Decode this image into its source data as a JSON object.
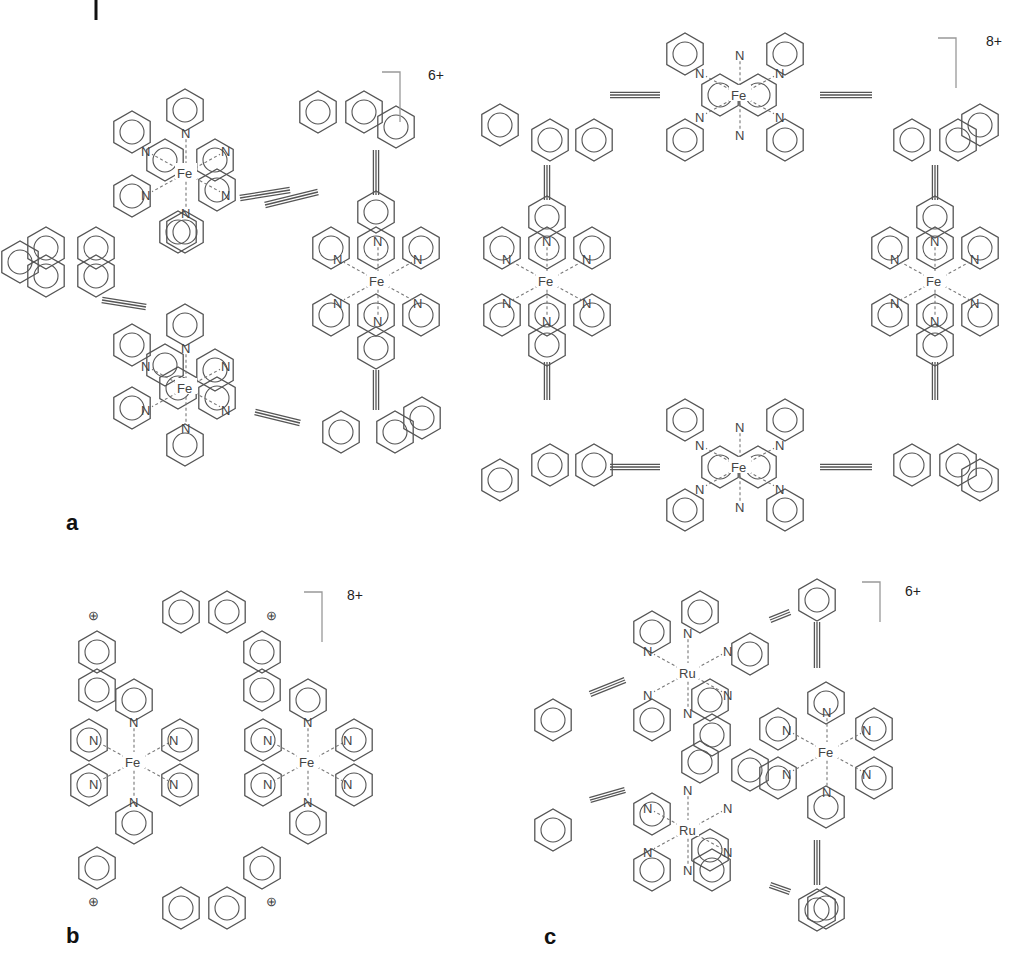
{
  "figure": {
    "top_fragment": {
      "text": "(   )                                              (   )",
      "x": 140,
      "y": 4
    },
    "panels": [
      {
        "id": "a",
        "label": "a",
        "x": 66,
        "y": 530
      },
      {
        "id": "b",
        "label": "b",
        "x": 66,
        "y": 943
      },
      {
        "id": "c",
        "label": "c",
        "x": 544,
        "y": 944
      }
    ],
    "charges": [
      {
        "panel": "a-left",
        "text": "6+",
        "x": 428,
        "y": 80,
        "bx": 400,
        "by": 72,
        "bh": 50
      },
      {
        "panel": "a-right",
        "text": "8+",
        "x": 986,
        "y": 46,
        "bx": 956,
        "by": 38,
        "bh": 50
      },
      {
        "panel": "b",
        "text": "8+",
        "x": 347,
        "y": 600,
        "bx": 322,
        "by": 592,
        "bh": 50
      },
      {
        "panel": "c",
        "text": "6+",
        "x": 905,
        "y": 596,
        "bx": 880,
        "by": 582,
        "bh": 40
      }
    ],
    "metals": [
      {
        "panel": "a-left",
        "symbol": "Fe",
        "x": 186,
        "y": 173
      },
      {
        "panel": "a-left",
        "symbol": "Fe",
        "x": 378,
        "y": 281
      },
      {
        "panel": "a-left",
        "symbol": "Fe",
        "x": 186,
        "y": 388
      },
      {
        "panel": "a-right",
        "symbol": "Fe",
        "x": 740,
        "y": 95
      },
      {
        "panel": "a-right",
        "symbol": "Fe",
        "x": 547,
        "y": 281
      },
      {
        "panel": "a-right",
        "symbol": "Fe",
        "x": 935,
        "y": 281
      },
      {
        "panel": "a-right",
        "symbol": "Fe",
        "x": 740,
        "y": 467
      },
      {
        "panel": "b",
        "symbol": "Fe",
        "x": 134,
        "y": 762
      },
      {
        "panel": "b",
        "symbol": "Fe",
        "x": 308,
        "y": 762
      },
      {
        "panel": "c",
        "symbol": "Ru",
        "x": 688,
        "y": 673
      },
      {
        "panel": "c",
        "symbol": "Fe",
        "x": 827,
        "y": 752
      },
      {
        "panel": "c",
        "symbol": "Ru",
        "x": 688,
        "y": 830
      }
    ],
    "atom_label": "N",
    "cation_label": "⊕",
    "rings": [
      [
        185,
        110
      ],
      [
        132,
        132
      ],
      [
        178,
        232
      ],
      [
        217,
        190
      ],
      [
        165,
        160
      ],
      [
        215,
        160
      ],
      [
        132,
        196
      ],
      [
        185,
        232
      ],
      [
        20,
        262
      ],
      [
        46,
        248
      ],
      [
        46,
        276
      ],
      [
        96,
        276
      ],
      [
        96,
        248
      ],
      [
        185,
        325
      ],
      [
        132,
        345
      ],
      [
        178,
        388
      ],
      [
        217,
        398
      ],
      [
        165,
        365
      ],
      [
        215,
        370
      ],
      [
        132,
        408
      ],
      [
        185,
        445
      ],
      [
        376,
        212
      ],
      [
        376,
        348
      ],
      [
        331,
        248
      ],
      [
        421,
        248
      ],
      [
        331,
        315
      ],
      [
        421,
        315
      ],
      [
        376,
        248
      ],
      [
        376,
        315
      ],
      [
        318,
        112
      ],
      [
        364,
        112
      ],
      [
        396,
        127
      ],
      [
        341,
        432
      ],
      [
        395,
        432
      ],
      [
        422,
        418
      ],
      [
        685,
        54
      ],
      [
        785,
        54
      ],
      [
        685,
        140
      ],
      [
        785,
        140
      ],
      [
        720,
        95
      ],
      [
        758,
        95
      ],
      [
        550,
        140
      ],
      [
        594,
        140
      ],
      [
        500,
        125
      ],
      [
        912,
        140
      ],
      [
        958,
        140
      ],
      [
        980,
        125
      ],
      [
        547,
        217
      ],
      [
        547,
        345
      ],
      [
        502,
        248
      ],
      [
        592,
        248
      ],
      [
        502,
        315
      ],
      [
        592,
        315
      ],
      [
        547,
        248
      ],
      [
        547,
        315
      ],
      [
        935,
        217
      ],
      [
        935,
        345
      ],
      [
        890,
        248
      ],
      [
        980,
        248
      ],
      [
        890,
        315
      ],
      [
        980,
        315
      ],
      [
        935,
        248
      ],
      [
        935,
        315
      ],
      [
        550,
        465
      ],
      [
        594,
        465
      ],
      [
        500,
        480
      ],
      [
        912,
        465
      ],
      [
        958,
        465
      ],
      [
        980,
        480
      ],
      [
        685,
        420
      ],
      [
        785,
        420
      ],
      [
        685,
        510
      ],
      [
        785,
        510
      ],
      [
        720,
        467
      ],
      [
        758,
        467
      ],
      [
        181,
        612
      ],
      [
        227,
        612
      ],
      [
        97,
        652
      ],
      [
        262,
        652
      ],
      [
        97,
        690
      ],
      [
        262,
        690
      ],
      [
        134,
        700
      ],
      [
        308,
        700
      ],
      [
        89,
        740
      ],
      [
        180,
        740
      ],
      [
        263,
        740
      ],
      [
        354,
        740
      ],
      [
        89,
        785
      ],
      [
        180,
        785
      ],
      [
        263,
        785
      ],
      [
        354,
        785
      ],
      [
        134,
        823
      ],
      [
        308,
        823
      ],
      [
        97,
        868
      ],
      [
        262,
        868
      ],
      [
        181,
        908
      ],
      [
        227,
        908
      ],
      [
        817,
        600
      ],
      [
        700,
        612
      ],
      [
        652,
        632
      ],
      [
        750,
        654
      ],
      [
        710,
        700
      ],
      [
        652,
        720
      ],
      [
        712,
        735
      ],
      [
        553,
        720
      ],
      [
        826,
        703
      ],
      [
        778,
        729
      ],
      [
        874,
        729
      ],
      [
        778,
        778
      ],
      [
        874,
        778
      ],
      [
        826,
        807
      ],
      [
        553,
        830
      ],
      [
        652,
        814
      ],
      [
        710,
        850
      ],
      [
        700,
        762
      ],
      [
        750,
        770
      ],
      [
        652,
        870
      ],
      [
        712,
        870
      ],
      [
        826,
        908
      ],
      [
        817,
        910
      ]
    ],
    "triple_bonds": [
      [
        240,
        198,
        290,
        190
      ],
      [
        102,
        300,
        146,
        307
      ],
      [
        255,
        412,
        300,
        423
      ],
      [
        265,
        205,
        318,
        192
      ],
      [
        376,
        150,
        376,
        195
      ],
      [
        376,
        370,
        376,
        410
      ],
      [
        610,
        95,
        660,
        95
      ],
      [
        820,
        95,
        872,
        95
      ],
      [
        547,
        165,
        547,
        200
      ],
      [
        935,
        165,
        935,
        200
      ],
      [
        547,
        362,
        547,
        400
      ],
      [
        935,
        362,
        935,
        400
      ],
      [
        610,
        467,
        660,
        467
      ],
      [
        820,
        467,
        872,
        467
      ],
      [
        590,
        694,
        625,
        680
      ],
      [
        790,
        612,
        770,
        620
      ],
      [
        817,
        622,
        817,
        668
      ],
      [
        590,
        800,
        625,
        790
      ],
      [
        817,
        840,
        817,
        885
      ],
      [
        770,
        885,
        790,
        892
      ]
    ]
  }
}
